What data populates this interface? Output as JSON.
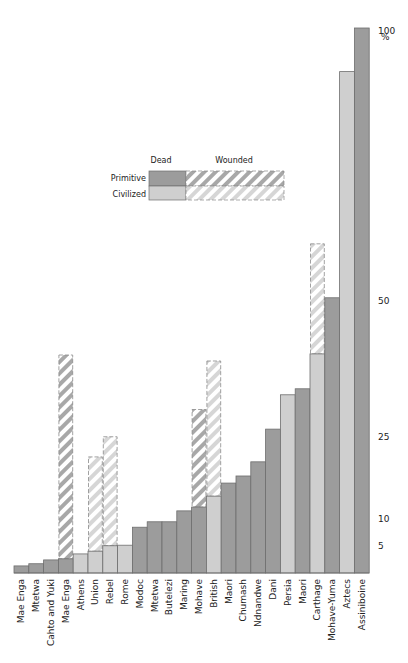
{
  "colors": {
    "primitive": "#9c9c9c",
    "civilized": "#cfcfcf",
    "primitive_stripe": "#a8a8a8",
    "civilized_stripe": "#d6d6d6",
    "outline": "#6e6e6e"
  },
  "legend": {
    "col_dead": "Dead",
    "col_wounded": "Wounded",
    "row_primitive": "Primitive",
    "row_civilized": "Civilized"
  },
  "axis": {
    "ticks": [
      {
        "value": 100,
        "label": "100"
      },
      {
        "value": 50,
        "label": "50"
      },
      {
        "value": 25,
        "label": "25"
      },
      {
        "value": 10,
        "label": "10"
      },
      {
        "value": 5,
        "label": "5"
      }
    ],
    "unit": "%"
  },
  "chart_data": {
    "type": "bar",
    "title": "",
    "xlabel": "",
    "ylabel": "%",
    "ylim": [
      0,
      100
    ],
    "grid": false,
    "legend_position": "upper-center",
    "categories": [
      "Mae Enga",
      "Mtetwa",
      "Cahto and Yuki",
      "Mae Enga",
      "Athens",
      "Union",
      "Rebel",
      "Rome",
      "Modoc",
      "Mtetwa",
      "Butelezi",
      "Maring",
      "Mohave",
      "British",
      "Maori",
      "Chumash",
      "Ndnandwe",
      "Dani",
      "Persia",
      "Maori",
      "Carthage",
      "Mohave-Yuma",
      "Aztecs",
      "Assiniboine"
    ],
    "group": [
      "Primitive",
      "Primitive",
      "Primitive",
      "Primitive",
      "Civilized",
      "Civilized",
      "Civilized",
      "Civilized",
      "Primitive",
      "Primitive",
      "Primitive",
      "Primitive",
      "Primitive",
      "Civilized",
      "Primitive",
      "Primitive",
      "Primitive",
      "Primitive",
      "Civilized",
      "Primitive",
      "Civilized",
      "Primitive",
      "Civilized",
      "Primitive"
    ],
    "series": [
      {
        "name": "Dead",
        "values": [
          1.3,
          1.7,
          2.4,
          2.6,
          3.5,
          4.0,
          5.0,
          5.1,
          8.4,
          9.4,
          9.4,
          11.4,
          12.1,
          14.1,
          16.5,
          17.8,
          20.4,
          26.4,
          32.7,
          33.8,
          40.2,
          50.5,
          92,
          100
        ]
      },
      {
        "name": "Dead + Wounded",
        "values": [
          null,
          null,
          null,
          40,
          null,
          21.3,
          25,
          null,
          null,
          null,
          null,
          null,
          30,
          38.9,
          null,
          null,
          null,
          null,
          null,
          null,
          60.4,
          null,
          null,
          null
        ]
      }
    ]
  }
}
